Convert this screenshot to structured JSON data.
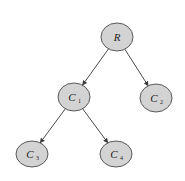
{
  "diagram": {
    "type": "tree",
    "colors": {
      "node_fill": "#d3d3d3",
      "node_stroke": "#5a5a5a",
      "edge": "#4a4a4a",
      "background": "#ffffff"
    },
    "nodes": [
      {
        "id": "R",
        "label": "R",
        "subscript": "",
        "cx": 117,
        "cy": 37,
        "rx": 16,
        "ry": 14
      },
      {
        "id": "C1",
        "label": "C",
        "subscript": "1",
        "cx": 74,
        "cy": 97,
        "rx": 16,
        "ry": 14
      },
      {
        "id": "C2",
        "label": "C",
        "subscript": "2",
        "cx": 156,
        "cy": 98,
        "rx": 16,
        "ry": 14
      },
      {
        "id": "C3",
        "label": "C",
        "subscript": "3",
        "cx": 32,
        "cy": 154,
        "rx": 16,
        "ry": 13
      },
      {
        "id": "C4",
        "label": "C",
        "subscript": "4",
        "cx": 116,
        "cy": 154,
        "rx": 16,
        "ry": 13
      }
    ],
    "edges": [
      {
        "from": "R",
        "to": "C1",
        "directed": true
      },
      {
        "from": "R",
        "to": "C2",
        "directed": true
      },
      {
        "from": "C1",
        "to": "C3",
        "directed": true
      },
      {
        "from": "C1",
        "to": "C4",
        "directed": true
      }
    ]
  }
}
